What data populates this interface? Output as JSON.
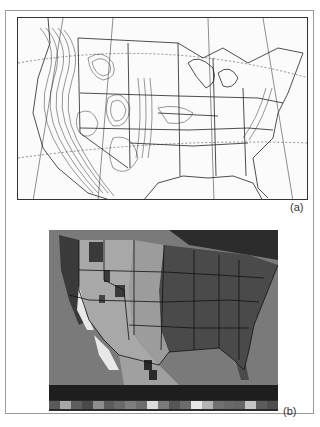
{
  "figure": {
    "panels": [
      {
        "id": "a",
        "label": "(a)",
        "description": "Contour map of the contiguous United States with state boundaries, latitude/longitude graticule and dense terrain contours over the western mountains"
      },
      {
        "id": "b",
        "label": "(b)",
        "description": "Grayscale-shaded gridded map of the contiguous United States with state boundaries and a categorical color legend strip below"
      }
    ],
    "legend_b": {
      "swatches": [
        "#5a5a5a",
        "#a8a8a8",
        "#5e5e5e",
        "#4a4a4a",
        "#8e8e8e",
        "#5c5c5c",
        "#6a6a6a",
        "#7e7e7e",
        "#6e6e6e",
        "#dcdcdc",
        "#7a7a7a",
        "#555555",
        "#6c6c6c",
        "#e6e6e6",
        "#b4b4b4",
        "#707070",
        "#686868",
        "#666666",
        "#c4c4c4",
        "#5c5c5c",
        "#4e4e4e"
      ]
    },
    "colors": {
      "frame_border": "#9a9a9a",
      "panel_b_water": "#7a7a7a",
      "panel_b_east": "#4a4a4a",
      "panel_b_plains": "#a4a4a4",
      "panel_b_desert": "#e8e8e8",
      "legend_band": "#1e1e1e"
    }
  }
}
